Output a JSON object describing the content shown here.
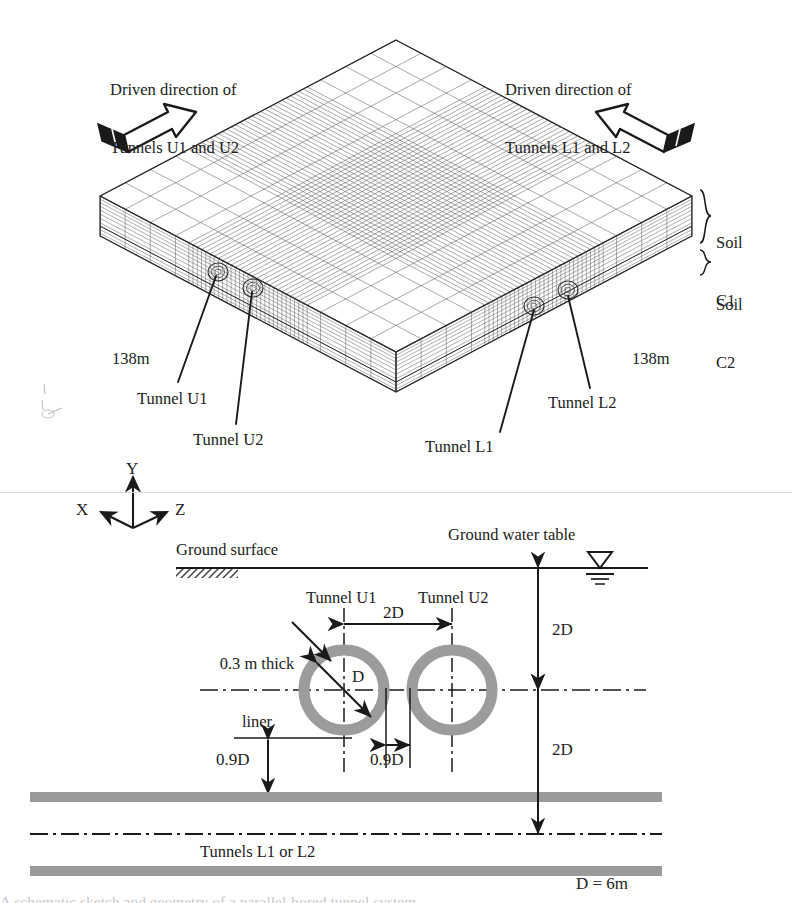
{
  "figure": {
    "caption": "A schematic sketch and geometry of a parallel-bored tunnel system",
    "units_note": "D = 6m"
  },
  "mesh_view": {
    "driven_left": {
      "line1": "Driven direction of",
      "line2": "Tunnels U1 and U2"
    },
    "driven_right": {
      "line1": "Driven direction of",
      "line2": "Tunnels L1 and L2"
    },
    "soil_layers": [
      {
        "name_line1": "Soil",
        "name_line2": "C1"
      },
      {
        "name_line1": "Soil",
        "name_line2": "C2"
      }
    ],
    "dimension_left": "138m",
    "dimension_right": "138m",
    "tunnel_callouts": [
      {
        "label": "Tunnel U1"
      },
      {
        "label": "Tunnel U2"
      },
      {
        "label": "Tunnel L1"
      },
      {
        "label": "Tunnel L2"
      }
    ],
    "small_axis": {
      "x": "x",
      "y": "y",
      "z": "z"
    }
  },
  "axis_triad": {
    "x": "X",
    "y": "Y",
    "z": "Z"
  },
  "section_view": {
    "ground_surface": "Ground surface",
    "ground_water_table": "Ground water table",
    "tunnel_u1": "Tunnel U1",
    "tunnel_u2": "Tunnel U2",
    "liner_note_line1": "0.3 m thick",
    "liner_note_line2": "liner",
    "diameter_label": "D",
    "spacing_top": "2D",
    "spacing_between": "0.9D",
    "cover_to_layer": "0.9D",
    "depth_upper": "2D",
    "depth_lower": "2D",
    "lower_tunnels": "Tunnels L1 or L2",
    "diameter_value": "D = 6m"
  },
  "colors": {
    "line": "#2b2b2b",
    "mesh": "#5a5a5a",
    "liner_gray": "#9c9c9c",
    "layer_gray": "#9a9a9a",
    "background": "#ffffff"
  }
}
